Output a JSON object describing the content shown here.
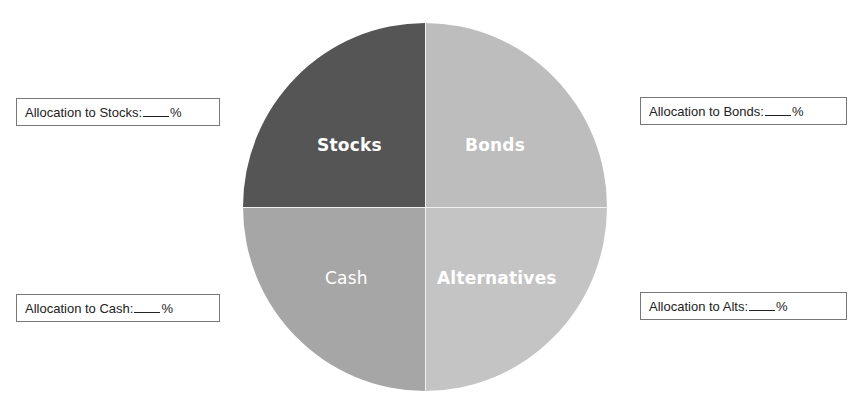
{
  "chart_data": {
    "type": "pie",
    "title": "",
    "slices": [
      {
        "label": "Stocks",
        "value": 25,
        "color": "#555555",
        "position": "top-left"
      },
      {
        "label": "Bonds",
        "value": 25,
        "color": "#bdbdbd",
        "position": "top-right"
      },
      {
        "label": "Cash",
        "value": 25,
        "color": "#a6a6a6",
        "position": "bottom-left"
      },
      {
        "label": "Alternatives",
        "value": 25,
        "color": "#c4c4c4",
        "position": "bottom-right"
      }
    ],
    "legend": "none",
    "annotations": [
      "Allocation to Stocks:___%",
      "Allocation to Bonds:___%",
      "Allocation to Cash:___%",
      "Allocation to Alts:___%"
    ]
  },
  "pie": {
    "stocks": {
      "label": "Stocks",
      "color": "#555555"
    },
    "bonds": {
      "label": "Bonds",
      "color": "#bdbdbd"
    },
    "cash": {
      "label": "Cash",
      "color": "#a6a6a6"
    },
    "alternatives": {
      "label": "Alternatives",
      "color": "#c4c4c4"
    }
  },
  "allocation_boxes": {
    "stocks": {
      "prefix": "Allocation to Stocks:",
      "suffix": "%"
    },
    "bonds": {
      "prefix": "Allocation to Bonds:",
      "suffix": "%"
    },
    "cash": {
      "prefix": "Allocation to Cash:",
      "suffix": "%"
    },
    "alts": {
      "prefix": "Allocation to Alts:",
      "suffix": "%"
    }
  }
}
